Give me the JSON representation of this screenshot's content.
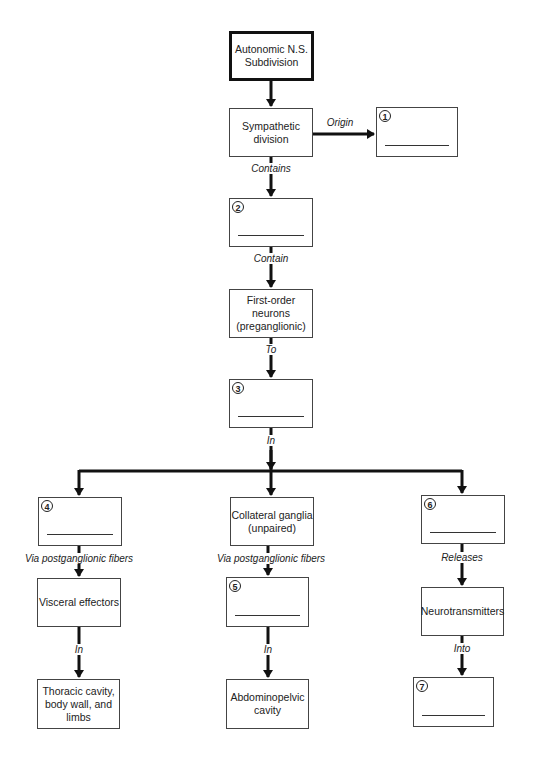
{
  "diagram": {
    "root": {
      "label": "Autonomic N.S. Subdivision"
    },
    "nodes": {
      "sympathetic": {
        "label": "Sympathetic division"
      },
      "box1": {
        "number": "1",
        "label": ""
      },
      "box2": {
        "number": "2",
        "label": ""
      },
      "first_order": {
        "label": "First-order neurons (preganglionic)"
      },
      "box3": {
        "number": "3",
        "label": ""
      },
      "box4": {
        "number": "4",
        "label": ""
      },
      "collateral": {
        "label": "Collateral ganglia (unpaired)"
      },
      "box6": {
        "number": "6",
        "label": ""
      },
      "visceral": {
        "label": "Visceral effectors"
      },
      "box5": {
        "number": "5",
        "label": ""
      },
      "neurotransmitters": {
        "label": "Neurotransmitters"
      },
      "thoracic": {
        "label": "Thoracic cavity, body wall, and limbs"
      },
      "abdominopelvic": {
        "label": "Abdominopelvic cavity"
      },
      "box7": {
        "number": "7",
        "label": ""
      }
    },
    "edges": {
      "origin": "Origin",
      "contains": "Contains",
      "contain": "Contain",
      "to": "To",
      "in_main": "In",
      "via_left": "Via postganglionic fibers",
      "via_center": "Via postganglionic fibers",
      "releases": "Releases",
      "in_left": "In",
      "in_center": "In",
      "into": "Into"
    },
    "colors": {
      "line": "#111111",
      "border": "#444444",
      "background": "#ffffff"
    }
  }
}
